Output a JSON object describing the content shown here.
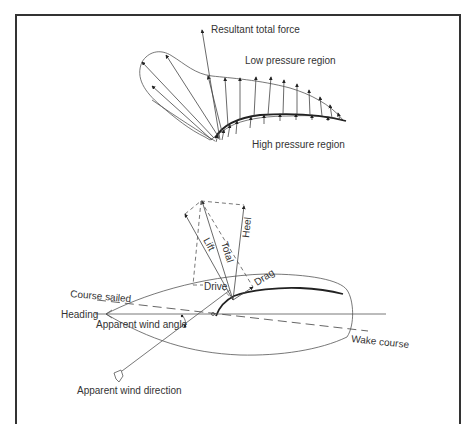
{
  "figure": {
    "top_diagram": {
      "labels": {
        "resultant": "Resultant total force",
        "low_pressure": "Low pressure region",
        "high_pressure": "High pressure region"
      }
    },
    "bottom_diagram": {
      "force_labels": {
        "lift": "Lift",
        "total": "Total",
        "heel": "Heel",
        "drive": "Drive",
        "drag": "Drag"
      },
      "labels": {
        "course_sailed": "Course sailed",
        "heading": "Heading",
        "apparent_wind_angle": "Apparent wind angle",
        "wake_course": "Wake course",
        "apparent_wind_direction": "Apparent wind direction"
      }
    },
    "colors": {
      "line": "#555555",
      "frame": "#333333",
      "background": "#ffffff"
    }
  }
}
